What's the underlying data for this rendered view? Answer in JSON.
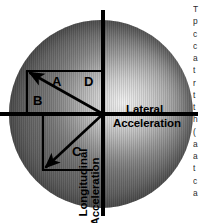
{
  "figure": {
    "type": "friction-circle",
    "title_visible": false,
    "axes": {
      "horizontal_label_line1": "Lateral",
      "horizontal_label_line2": "Acceleration",
      "vertical_label_line1": "Longitudinal",
      "vertical_label_line2": "Acceleration"
    },
    "vector_labels": {
      "a": "A",
      "b": "B",
      "c": "C",
      "d": "D"
    },
    "colors": {
      "axis": "#000000",
      "vector": "#000000",
      "disc_dark": "#606060",
      "disc_light": "#f2f2f2",
      "background": "#ffffff"
    }
  },
  "chart_data": {
    "type": "scatter",
    "xlabel": "Lateral Acceleration",
    "ylabel": "Longitudinal Acceleration",
    "grid": false,
    "legend": false,
    "circle": {
      "center_x": 0,
      "center_y": 0,
      "radius": 1.0
    },
    "xlim": [
      -1.0,
      1.0
    ],
    "ylim": [
      -1.0,
      1.0
    ],
    "vectors": [
      {
        "label": "A",
        "description": "resultant acceleration vector, upper-left quadrant (braking-left or accelerating-left combination)",
        "origin": [
          0,
          0
        ],
        "tip": [
          -0.82,
          0.46
        ],
        "components": [
          {
            "label": "A",
            "kind": "resultant",
            "axis": "resultant"
          },
          {
            "label": "D",
            "kind": "lateral-component",
            "axis": "x",
            "value": -0.82
          },
          {
            "label": "B",
            "kind": "longitudinal-component",
            "axis": "y",
            "value": 0.46
          }
        ]
      },
      {
        "label": "C",
        "description": "resultant acceleration vector, lower-left quadrant",
        "origin": [
          0,
          0
        ],
        "tip": [
          -0.66,
          -0.6
        ],
        "components": [
          {
            "label": "C",
            "kind": "resultant",
            "axis": "resultant"
          }
        ]
      }
    ],
    "annotations": [
      "A",
      "B",
      "C",
      "D",
      "Lateral",
      "Acceleration",
      "Longitudinal",
      "Acceleration"
    ]
  },
  "body_copy": {
    "clipped": true,
    "lines": [
      "T",
      "p",
      "c",
      "c",
      "a",
      "t",
      "r",
      "t",
      "t",
      "h",
      "(",
      "a",
      "a",
      "t",
      "c",
      "a"
    ]
  }
}
